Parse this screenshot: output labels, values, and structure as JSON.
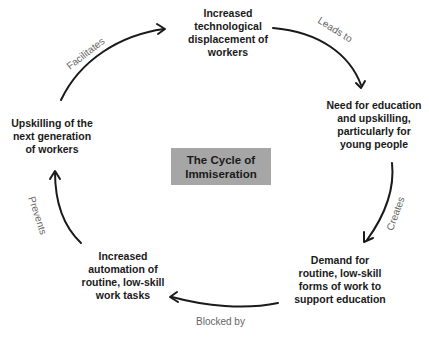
{
  "title": {
    "lines": [
      "The Cycle of",
      "Immiseration"
    ],
    "background": "#a6a6a6"
  },
  "nodes": [
    {
      "id": "top",
      "lines": [
        "Increased",
        "technological",
        "displacement of",
        "workers"
      ]
    },
    {
      "id": "right",
      "lines": [
        "Need for education",
        "and upskilling,",
        "particularly for",
        "young people"
      ]
    },
    {
      "id": "bottom-right",
      "lines": [
        "Demand for",
        "routine, low-skill",
        "forms of work to",
        "support education"
      ]
    },
    {
      "id": "bottom-left",
      "lines": [
        "Increased",
        "automation of",
        "routine, low-skill",
        "work tasks"
      ]
    },
    {
      "id": "left",
      "lines": [
        "Upskilling of the",
        "next generation",
        "of workers"
      ]
    }
  ],
  "edges": [
    {
      "from": "top",
      "to": "right",
      "label": "Leads to"
    },
    {
      "from": "right",
      "to": "bottom-right",
      "label": "Creates"
    },
    {
      "from": "bottom-right",
      "to": "bottom-left",
      "label": "Blocked by"
    },
    {
      "from": "bottom-left",
      "to": "left",
      "label": "Prevents"
    },
    {
      "from": "left",
      "to": "top",
      "label": "Facilitates"
    }
  ],
  "colors": {
    "arrow": "#1a1a1a",
    "label": "#666666",
    "text": "#1a1a1a"
  }
}
